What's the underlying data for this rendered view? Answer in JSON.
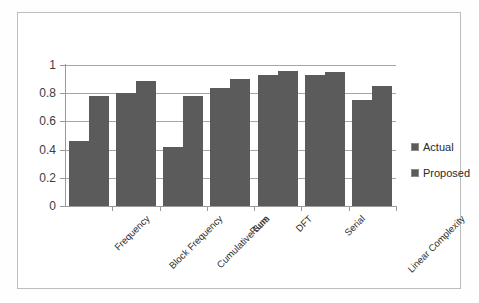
{
  "chart_data": {
    "type": "bar",
    "title": "",
    "subtitle": "",
    "xlabel": "",
    "ylabel": "",
    "ylim": [
      0,
      1
    ],
    "yticks": [
      "0",
      "0.2",
      "0.4",
      "0.6",
      "0.8",
      "1"
    ],
    "ytick_values": [
      0,
      0.2,
      0.4,
      0.6,
      0.8,
      1
    ],
    "grid": true,
    "legend_position": "right",
    "bar_color": "#5b5b5b",
    "categories": [
      "Frequency",
      "Block Frequency",
      "Cumulative Sum",
      "Runs",
      "DFT",
      "Serial",
      "Linear Complexity"
    ],
    "series": [
      {
        "name": "Actual",
        "values": [
          0.46,
          0.8,
          0.42,
          0.84,
          0.93,
          0.93,
          0.75
        ]
      },
      {
        "name": "Proposed",
        "values": [
          0.78,
          0.89,
          0.78,
          0.9,
          0.96,
          0.95,
          0.85
        ]
      }
    ]
  }
}
